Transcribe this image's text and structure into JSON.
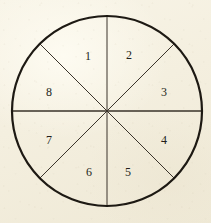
{
  "figure": {
    "kind": "circle-divided-into-sectors",
    "background_color": "#f4efdf",
    "ink_color": "#241f1a",
    "outline_color": "#1d1913",
    "divider_color": "#3a332a",
    "center": {
      "x": 107,
      "y": 111
    },
    "radius": 95,
    "outline_stroke_width": 2.2,
    "divider_stroke_width": 1.0,
    "sector_count": 8,
    "sector_angle_degrees": 45,
    "label_order": "counterclockwise",
    "dividers": [
      {
        "name": "vertical-diameter",
        "angle_degrees": 90
      },
      {
        "name": "horizontal-diameter",
        "angle_degrees": 0
      },
      {
        "name": "diagonal-diameter-ne-sw",
        "angle_degrees": 45
      },
      {
        "name": "diagonal-diameter-nw-se",
        "angle_degrees": 135
      }
    ],
    "sectors": [
      {
        "label": "1",
        "angle_center_degrees": 112.5,
        "label_x": 88,
        "label_y": 57
      },
      {
        "label": "2",
        "angle_center_degrees": 67.5,
        "label_x": 129,
        "label_y": 56
      },
      {
        "label": "3",
        "angle_center_degrees": 22.5,
        "label_x": 164,
        "label_y": 93
      },
      {
        "label": "4",
        "angle_center_degrees": 337.5,
        "label_x": 164,
        "label_y": 141
      },
      {
        "label": "5",
        "angle_center_degrees": 292.5,
        "label_x": 128,
        "label_y": 173
      },
      {
        "label": "6",
        "angle_center_degrees": 247.5,
        "label_x": 89,
        "label_y": 173
      },
      {
        "label": "7",
        "angle_center_degrees": 202.5,
        "label_x": 49,
        "label_y": 141
      },
      {
        "label": "8",
        "angle_center_degrees": 157.5,
        "label_x": 49,
        "label_y": 93
      }
    ]
  }
}
